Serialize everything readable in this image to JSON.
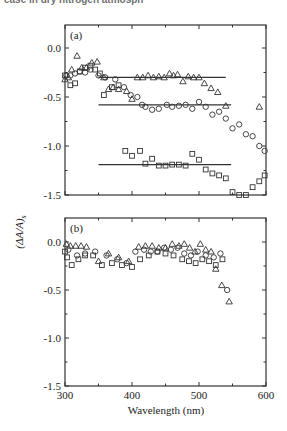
{
  "caption_fragment": "ease in dry nitrogen atmosph",
  "chart_data": [
    {
      "type": "scatter",
      "panel_label": "(a)",
      "xlabel": "Wavelength (nm)",
      "ylabel": "(ΔA/A)s",
      "xlim": [
        300,
        600
      ],
      "ylim": [
        -1.5,
        0.23
      ],
      "x_ticks": [
        300,
        400,
        500,
        600
      ],
      "y_ticks": [
        "0.0",
        "-0.5",
        "-1.0",
        "-1.5"
      ],
      "y_tick_values": [
        0.0,
        -0.5,
        -1.0,
        -1.5
      ],
      "grid": false,
      "series": [
        {
          "name": "triangles",
          "marker": "triangle",
          "x": [
            300,
            305,
            310,
            318,
            325,
            332,
            340,
            348,
            358,
            365,
            372,
            380,
            392,
            400,
            408,
            416,
            424,
            432,
            440,
            448,
            456,
            462,
            468,
            476,
            484,
            492,
            500,
            508,
            518,
            528,
            540,
            590
          ],
          "y": [
            -0.32,
            -0.3,
            -0.22,
            -0.08,
            -0.2,
            -0.2,
            -0.15,
            -0.14,
            -0.3,
            -0.42,
            -0.4,
            -0.42,
            -0.44,
            -0.52,
            -0.3,
            -0.3,
            -0.28,
            -0.3,
            -0.29,
            -0.3,
            -0.26,
            -0.28,
            -0.27,
            -0.34,
            -0.29,
            -0.3,
            -0.3,
            -0.36,
            -0.41,
            -0.45,
            -0.59,
            -0.6
          ],
          "fit_line": {
            "x": [
              350,
              540
            ],
            "y": -0.3
          }
        },
        {
          "name": "circles",
          "marker": "circle",
          "x": [
            302,
            308,
            315,
            322,
            330,
            338,
            350,
            360,
            375,
            388,
            398,
            408,
            415,
            420,
            430,
            440,
            452,
            460,
            470,
            480,
            490,
            500,
            510,
            520,
            530,
            540,
            550,
            560,
            570,
            580,
            590,
            598
          ],
          "y": [
            -0.28,
            -0.28,
            -0.26,
            -0.24,
            -0.25,
            -0.22,
            -0.28,
            -0.3,
            -0.32,
            -0.4,
            -0.48,
            -0.5,
            -0.58,
            -0.6,
            -0.63,
            -0.62,
            -0.58,
            -0.6,
            -0.59,
            -0.58,
            -0.62,
            -0.55,
            -0.6,
            -0.68,
            -0.65,
            -0.72,
            -0.82,
            -0.78,
            -0.88,
            -0.9,
            -1.0,
            -1.05
          ],
          "fit_line": {
            "x": [
              350,
              548
            ],
            "y": -0.58
          }
        },
        {
          "name": "squares",
          "marker": "square",
          "x": [
            300,
            308,
            315,
            322,
            330,
            338,
            345,
            352,
            358,
            370,
            380,
            390,
            400,
            412,
            420,
            430,
            440,
            450,
            460,
            470,
            480,
            490,
            500,
            510,
            520,
            530,
            540,
            550,
            560,
            570,
            580,
            590,
            598
          ],
          "y": [
            -0.28,
            -0.38,
            -0.36,
            -0.24,
            -0.2,
            -0.18,
            -0.22,
            -0.26,
            -0.48,
            -0.4,
            -0.38,
            -1.05,
            -1.1,
            -1.05,
            -1.18,
            -1.13,
            -1.2,
            -1.2,
            -1.19,
            -1.19,
            -1.2,
            -1.08,
            -1.14,
            -1.24,
            -1.28,
            -1.3,
            -1.33,
            -1.47,
            -1.5,
            -1.5,
            -1.42,
            -1.36,
            -1.3
          ],
          "fit_line": {
            "x": [
              350,
              548
            ],
            "y": -1.19
          }
        }
      ]
    },
    {
      "type": "scatter",
      "panel_label": "(b)",
      "xlabel": "Wavelength (nm)",
      "ylabel": "(ΔA/A)s",
      "xlim": [
        300,
        600
      ],
      "ylim": [
        -1.5,
        0.23
      ],
      "x_ticks": [
        300,
        400,
        500,
        600
      ],
      "y_ticks": [
        "0.0",
        "-0.5",
        "-1.0",
        "-1.5"
      ],
      "y_tick_values": [
        0.0,
        -0.5,
        -1.0,
        -1.5
      ],
      "grid": false,
      "series": [
        {
          "name": "triangles",
          "marker": "triangle",
          "x": [
            302,
            308,
            316,
            324,
            332,
            350,
            365,
            380,
            395,
            410,
            420,
            430,
            440,
            450,
            460,
            470,
            478,
            486,
            494,
            502,
            510,
            518,
            525,
            534,
            545
          ],
          "y": [
            -0.02,
            -0.04,
            -0.04,
            -0.04,
            -0.05,
            -0.2,
            -0.12,
            -0.16,
            -0.2,
            -0.05,
            -0.04,
            -0.04,
            -0.06,
            -0.06,
            -0.02,
            -0.04,
            -0.02,
            -0.06,
            -0.1,
            -0.02,
            -0.08,
            -0.1,
            -0.28,
            -0.45,
            -0.62
          ]
        },
        {
          "name": "circles",
          "marker": "circle",
          "x": [
            305,
            318,
            330,
            345,
            362,
            378,
            392,
            405,
            418,
            428,
            438,
            448,
            458,
            468,
            478,
            488,
            498,
            510,
            522,
            532,
            542
          ],
          "y": [
            -0.08,
            -0.14,
            -0.12,
            -0.1,
            -0.14,
            -0.18,
            -0.22,
            -0.1,
            -0.08,
            -0.1,
            -0.1,
            -0.06,
            -0.08,
            -0.06,
            -0.12,
            -0.14,
            -0.1,
            -0.14,
            -0.16,
            -0.12,
            -0.5
          ]
        },
        {
          "name": "squares",
          "marker": "square",
          "x": [
            300,
            303,
            310,
            320,
            330,
            342,
            355,
            370,
            385,
            400,
            412,
            425,
            438,
            450,
            462,
            475,
            485,
            495,
            505,
            515,
            525,
            535
          ],
          "y": [
            -0.1,
            -0.16,
            -0.24,
            -0.18,
            -0.14,
            -0.14,
            -0.24,
            -0.22,
            -0.24,
            -0.26,
            -0.18,
            -0.14,
            -0.1,
            -0.12,
            -0.14,
            -0.18,
            -0.2,
            -0.22,
            -0.18,
            -0.2,
            -0.24,
            -0.18
          ]
        }
      ]
    }
  ]
}
